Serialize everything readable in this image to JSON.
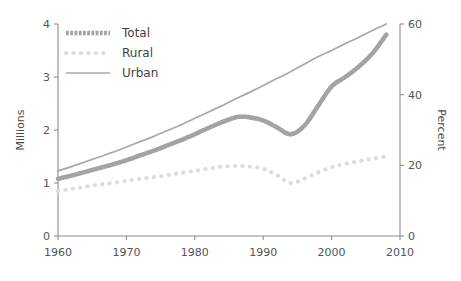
{
  "chart_data": {
    "type": "line",
    "title": "",
    "subtitle": "",
    "xlabel": "",
    "ylabel": "Millions",
    "y2label": "Percent",
    "xlim": [
      1960,
      2010
    ],
    "ylim": [
      0,
      4
    ],
    "y2lim": [
      0,
      60
    ],
    "grid": false,
    "legend_position": "top-left",
    "xticks": [
      "1960",
      "1970",
      "1980",
      "1990",
      "2000",
      "2010"
    ],
    "xtick_values": [
      1960,
      1970,
      1980,
      1990,
      2000,
      2010
    ],
    "yticks": [
      "0",
      "1",
      "2",
      "3",
      "4"
    ],
    "ytick_values": [
      0,
      1,
      2,
      3,
      4
    ],
    "y2ticks": [
      "0",
      "20",
      "40",
      "60"
    ],
    "y2tick_values": [
      0,
      20,
      40,
      60
    ],
    "x": [
      1960,
      1962,
      1964,
      1966,
      1968,
      1970,
      1972,
      1974,
      1976,
      1978,
      1980,
      1982,
      1984,
      1986,
      1987,
      1988,
      1990,
      1992,
      1994,
      1996,
      1998,
      2000,
      2002,
      2004,
      2006,
      2008
    ],
    "series": [
      {
        "name": "Total",
        "style": "thick-dashed",
        "color": "#a3a3a3",
        "width": 4.6,
        "values": [
          1.08,
          1.14,
          1.21,
          1.28,
          1.35,
          1.43,
          1.52,
          1.61,
          1.71,
          1.81,
          1.92,
          2.04,
          2.15,
          2.24,
          2.25,
          2.24,
          2.18,
          2.05,
          1.92,
          2.08,
          2.45,
          2.82,
          3.0,
          3.2,
          3.45,
          3.8
        ]
      },
      {
        "name": "Rural",
        "style": "dotted",
        "color": "#dcdcdc",
        "width": 4.2,
        "values": [
          0.85,
          0.89,
          0.93,
          0.97,
          1.0,
          1.04,
          1.08,
          1.11,
          1.15,
          1.19,
          1.23,
          1.27,
          1.31,
          1.32,
          1.32,
          1.31,
          1.27,
          1.15,
          1.0,
          1.08,
          1.2,
          1.3,
          1.36,
          1.41,
          1.46,
          1.5
        ]
      },
      {
        "name": "Urban",
        "style": "solid",
        "color": "#a8a8a8",
        "width": 1.7,
        "values": [
          1.23,
          1.31,
          1.4,
          1.49,
          1.58,
          1.68,
          1.78,
          1.88,
          1.99,
          2.1,
          2.22,
          2.34,
          2.46,
          2.59,
          2.65,
          2.71,
          2.84,
          2.97,
          3.1,
          3.24,
          3.38,
          3.5,
          3.63,
          3.75,
          3.88,
          4.0
        ]
      }
    ]
  },
  "legend": {
    "items": [
      {
        "label": "Total"
      },
      {
        "label": "Rural"
      },
      {
        "label": "Urban"
      }
    ]
  }
}
